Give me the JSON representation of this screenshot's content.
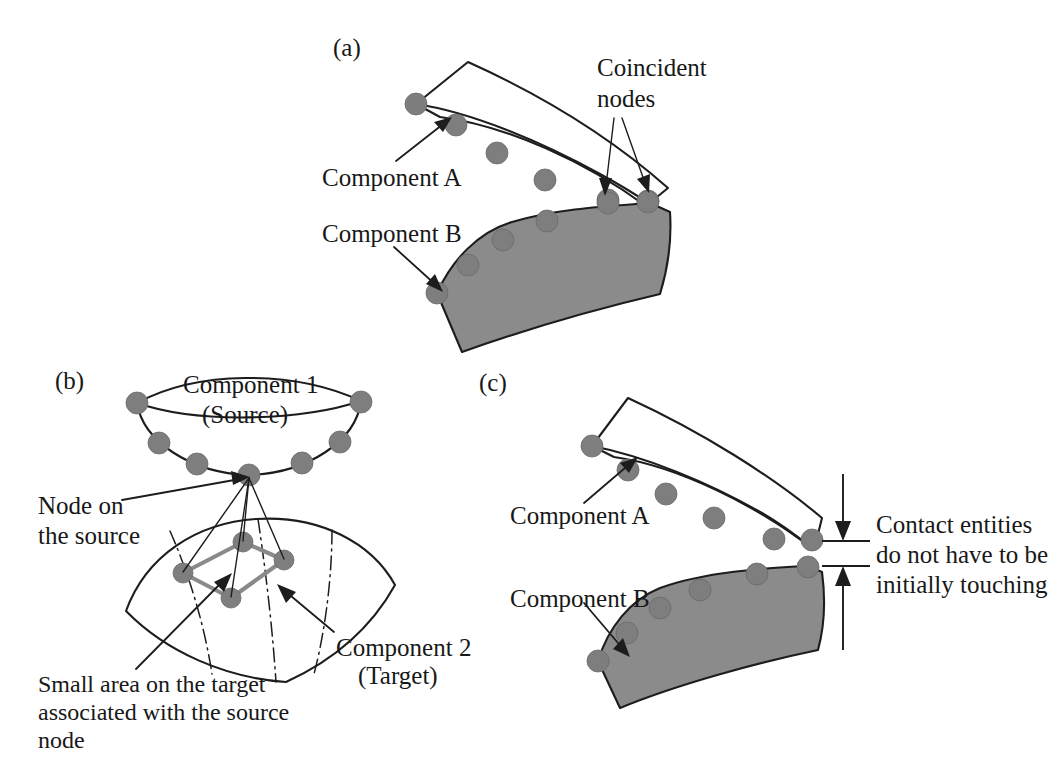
{
  "figure": {
    "background_color": "#ffffff",
    "ink_color": "#1d1d1d",
    "node_color": "#7e7e7e",
    "filled_body_color": "#8b8b8b"
  },
  "panels": {
    "a": {
      "label": "(a)",
      "annotations": {
        "component_a": "Component A",
        "component_b": "Component B",
        "coincident_line1": "Coincident",
        "coincident_line2": "nodes"
      }
    },
    "b": {
      "label": "(b)",
      "annotations": {
        "component_1_line1": "Component 1",
        "component_1_line2": "(Source)",
        "component_2_line1": "Component 2",
        "component_2_line2": "(Target)",
        "node_on_source_line1": "Node on",
        "node_on_source_line2": "the source",
        "small_area_line1": "Small area on the target",
        "small_area_line2": "associated with the source",
        "small_area_line3": "node"
      }
    },
    "c": {
      "label": "(c)",
      "annotations": {
        "component_a": "Component A",
        "component_b": "Component B",
        "gap_note_line1": "Contact entities",
        "gap_note_line2": "do not have to be",
        "gap_note_line3": "initially touching"
      }
    }
  },
  "geometry": {
    "panel_a": {
      "component_a_body": "M 416 104 L 468 62 C 545 96 612 138 665 186 L 645 205 C 588 164 510 128 440 118 Z",
      "component_a_right_edge": "M 665 186 L 645 205",
      "component_a_bottom_curve": "M 416 104 C 470 112 540 140 600 172 C 620 184 635 194 645 205",
      "component_b_body": "M 437 293 L 463 205 C 530 218 600 232 658 211 L 668 215 C 668 250 664 275 658 295 C 600 312 520 330 458 351 Z",
      "component_a_nodes": [
        [
          416,
          104
        ],
        [
          455,
          124
        ],
        [
          495,
          152
        ],
        [
          543,
          179
        ],
        [
          608,
          200
        ],
        [
          648,
          200
        ]
      ],
      "component_b_nodes": [
        [
          437,
          293
        ],
        [
          470,
          265
        ],
        [
          504,
          239
        ],
        [
          547,
          220
        ],
        [
          608,
          203
        ],
        [
          648,
          202
        ]
      ],
      "leader_component_a": "M 397 160 L 448 120",
      "leader_component_b": "M 395 247 L 440 288",
      "coincident_leader_left": "M 616 140 L 607 196",
      "coincident_leader_right": "M 623 141 L 646 192",
      "label_positions": {
        "panel": [
          333,
          56
        ],
        "component_a": [
          325,
          184
        ],
        "component_b": [
          325,
          240
        ],
        "coincident_line1": [
          598,
          75
        ],
        "coincident_line2": [
          598,
          105
        ]
      }
    },
    "panel_b": {
      "source_top_rim": "M 137 403 C 200 372 290 370 360 400 C 300 420 200 424 137 403 Z",
      "source_bowl": "M 137 403 C 142 440 190 473 249 474 C 308 473 355 440 360 400",
      "source_nodes": [
        [
          137,
          403
        ],
        [
          158,
          442
        ],
        [
          196,
          463
        ],
        [
          249,
          474
        ],
        [
          303,
          462
        ],
        [
          341,
          441
        ],
        [
          360,
          402
        ]
      ],
      "target_surface": "M 128 610 C 150 556 200 524 258 520 C 320 517 370 545 392 585 C 368 628 330 660 286 680 C 228 676 168 650 128 610 Z",
      "target_grid": [
        "M 170 529 C 190 570 206 620 214 672",
        "M 258 520 C 266 566 272 620 276 680",
        "M 330 528 C 330 572 326 625 316 672"
      ],
      "patch_quad": "M 183 573 L 243 542 L 283 560 L 231 597 Z",
      "patch_nodes": [
        [
          183,
          573
        ],
        [
          243,
          542
        ],
        [
          283,
          560
        ],
        [
          231,
          597
        ]
      ],
      "source_node_focus": [
        249,
        474
      ],
      "fan_lines": [
        "M 249 474 L 183 573",
        "M 249 474 L 243 542",
        "M 249 474 L 283 560",
        "M 249 474 L 231 597"
      ],
      "leader_node_on_source": "M 127 498 L 243 478",
      "leader_small_area": "M 140 665 L 226 578",
      "leader_component_2": "M 330 628 L 281 588",
      "label_positions": {
        "panel": [
          57,
          388
        ],
        "component_1_line1": [
          185,
          392
        ],
        "component_1_line2": [
          202,
          420
        ],
        "node_on_source_line1": [
          40,
          512
        ],
        "node_on_source_line2": [
          40,
          541
        ],
        "component_2_line1": [
          338,
          654
        ],
        "component_2_line2": [
          360,
          681
        ],
        "small_area_line1": [
          40,
          690
        ],
        "small_area_line2": [
          40,
          717
        ],
        "small_area_line3": [
          40,
          744
        ]
      }
    },
    "panel_c": {
      "component_a_body": "M 592 446 L 629 398 C 700 432 770 474 820 516 L 812 548 C 760 508 680 468 612 458 Z",
      "component_a_bottom_curve": "M 592 446 C 645 455 710 480 764 512 C 788 526 802 538 812 548",
      "component_a_nodes": [
        [
          592,
          446
        ],
        [
          628,
          470
        ],
        [
          665,
          494
        ],
        [
          713,
          517
        ],
        [
          773,
          538
        ],
        [
          812,
          540
        ]
      ],
      "component_b_body": "M 598 660 L 620 583 C 680 589 752 580 812 566 L 822 572 C 824 602 822 626 818 648 C 760 660 680 680 620 706 Z",
      "component_b_nodes": [
        [
          598,
          660
        ],
        [
          627,
          633
        ],
        [
          660,
          608
        ],
        [
          700,
          590
        ],
        [
          757,
          573
        ],
        [
          808,
          567
        ]
      ],
      "leader_component_a": "M 586 502 L 634 460],",
      "leader_component_a_path": "M 586 502 L 634 460",
      "leader_component_b": "M 585 602 L 627 652",
      "dim_upper_line": "M 843 477 L 843 540",
      "dim_lower_line": "M 843 648 L 843 566",
      "dim_tick_top": "M 822 541 L 868 541",
      "dim_tick_bottom": "M 822 566 L 868 566",
      "label_positions": {
        "panel": [
          480,
          390
        ],
        "component_a": [
          512,
          522
        ],
        "component_b": [
          512,
          605
        ],
        "gap_note_line1": [
          876,
          532
        ],
        "gap_note_line2": [
          876,
          562
        ],
        "gap_note_line3": [
          876,
          592
        ]
      }
    }
  }
}
